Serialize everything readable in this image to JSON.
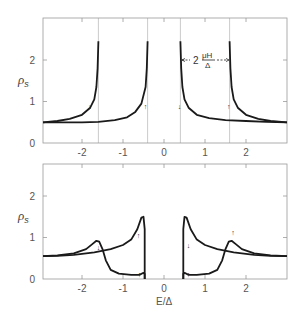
{
  "chart_data": [
    {
      "type": "line",
      "title": "",
      "xlabel": "",
      "ylabel": "ρs",
      "xlim": [
        -2.95,
        3.0
      ],
      "ylim": [
        0,
        3.0
      ],
      "xticks": [
        -2,
        -1,
        0,
        1,
        2
      ],
      "xtick_labels": [
        "-2",
        "-1",
        "0",
        "1",
        "2"
      ],
      "yticks": [
        0,
        1,
        2
      ],
      "ytick_labels": [
        "0",
        "1",
        "2"
      ],
      "grid": false,
      "vertical_lines": [
        -1.6,
        -0.4,
        0.4,
        1.6
      ],
      "annotation": {
        "text_prefix": "2",
        "numerator": "μH",
        "denominator": "Δ",
        "x_from": 0.4,
        "x_to": 1.6,
        "y": 2.0
      },
      "series": [
        {
          "name": "spin-down (↓)",
          "arrow": "↓",
          "description": "BCS-like density of states shifted by -μH; divergent at E/Δ = ±1.6 edge near -1.6 and +0.4",
          "left_branch": {
            "x": [
              -2.95,
              -2.6,
              -2.3,
              -2.0,
              -1.8,
              -1.7,
              -1.65,
              -1.62,
              -1.6
            ],
            "y": [
              0.5,
              0.53,
              0.58,
              0.68,
              0.85,
              1.05,
              1.35,
              1.8,
              2.45
            ]
          },
          "right_branch": {
            "x": [
              0.4,
              0.42,
              0.45,
              0.5,
              0.6,
              0.8,
              1.1,
              1.5,
              2.0,
              2.5,
              3.0
            ],
            "y": [
              2.45,
              1.8,
              1.35,
              1.05,
              0.85,
              0.68,
              0.6,
              0.55,
              0.53,
              0.51,
              0.5
            ]
          }
        },
        {
          "name": "spin-up (↑)",
          "arrow": "↑",
          "description": "BCS-like density of states shifted by +μH; divergent near -0.4 and +1.6",
          "left_branch": {
            "x": [
              -2.95,
              -2.0,
              -1.6,
              -1.2,
              -0.9,
              -0.7,
              -0.55,
              -0.45,
              -0.42,
              -0.4
            ],
            "y": [
              0.5,
              0.5,
              0.51,
              0.55,
              0.62,
              0.75,
              0.95,
              1.35,
              1.8,
              2.45
            ]
          },
          "right_branch": {
            "x": [
              1.6,
              1.62,
              1.65,
              1.7,
              1.8,
              2.0,
              2.3,
              2.6,
              3.0
            ],
            "y": [
              2.45,
              1.8,
              1.35,
              1.05,
              0.85,
              0.68,
              0.58,
              0.53,
              0.5
            ]
          }
        }
      ]
    },
    {
      "type": "line",
      "title": "",
      "xlabel": "E/Δ",
      "ylabel": "ρs",
      "xlim": [
        -2.95,
        3.0
      ],
      "ylim": [
        0,
        2.8
      ],
      "xticks": [
        -2,
        -1,
        0,
        1,
        2
      ],
      "xtick_labels": [
        "-2",
        "-1",
        "0",
        "1",
        "2"
      ],
      "yticks": [
        0,
        1,
        2
      ],
      "ytick_labels": [
        "0",
        "1",
        "2"
      ],
      "grid": false,
      "series": [
        {
          "name": "spin-down (↓)",
          "arrow": "↓",
          "description": "broadened DOS with peak ~0.93 near E/Δ=-1.6, dropping to ~0.1 gap floor, and peak ~1.5 at +0.5",
          "left_branch": {
            "x": [
              -2.95,
              -2.6,
              -2.2,
              -1.9,
              -1.75,
              -1.65,
              -1.58,
              -1.5,
              -1.42,
              -1.3,
              -1.1,
              -0.8,
              -0.6,
              -0.5,
              -0.47,
              -0.47
            ],
            "y": [
              0.55,
              0.57,
              0.62,
              0.72,
              0.84,
              0.92,
              0.9,
              0.72,
              0.45,
              0.22,
              0.13,
              0.1,
              0.1,
              0.15,
              0.12,
              0.0
            ]
          },
          "right_branch": {
            "x": [
              0.47,
              0.47,
              0.5,
              0.55,
              0.65,
              0.8,
              1.0,
              1.3,
              1.7,
              2.2,
              2.6,
              3.0
            ],
            "y": [
              0.0,
              1.2,
              1.5,
              1.48,
              1.2,
              0.95,
              0.82,
              0.72,
              0.64,
              0.58,
              0.56,
              0.55
            ]
          }
        },
        {
          "name": "spin-up (↑)",
          "arrow": "↑",
          "description": "mirror image: peak ~1.5 at -0.5, gap floor ~0.1 on right, peak ~0.93 near +1.6",
          "left_branch": {
            "x": [
              -2.95,
              -2.6,
              -2.2,
              -1.7,
              -1.3,
              -1.0,
              -0.8,
              -0.65,
              -0.55,
              -0.5,
              -0.47,
              -0.47
            ],
            "y": [
              0.55,
              0.56,
              0.58,
              0.64,
              0.72,
              0.82,
              0.95,
              1.2,
              1.48,
              1.5,
              1.2,
              0.0
            ]
          },
          "right_branch": {
            "x": [
              0.47,
              0.47,
              0.5,
              0.6,
              0.8,
              1.1,
              1.3,
              1.42,
              1.5,
              1.58,
              1.65,
              1.75,
              1.9,
              2.2,
              2.6,
              3.0
            ],
            "y": [
              0.0,
              0.12,
              0.15,
              0.1,
              0.1,
              0.13,
              0.22,
              0.45,
              0.72,
              0.9,
              0.92,
              0.84,
              0.72,
              0.62,
              0.57,
              0.55
            ]
          }
        }
      ]
    }
  ],
  "labels": {
    "ylabel_main": "ρ",
    "ylabel_sub": "s",
    "xlabel_bottom": "E/Δ",
    "annotation_prefix": "2",
    "annotation_num": "μH",
    "annotation_den": "Δ",
    "arrow_down": "↓",
    "arrow_up": "↑"
  }
}
